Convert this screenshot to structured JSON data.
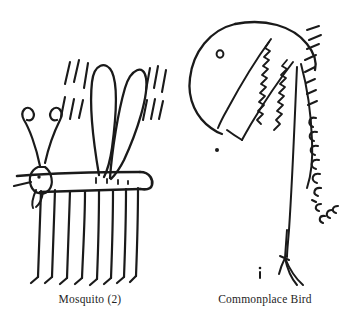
{
  "plate": {
    "background_color": "#ffffff",
    "ink_color": "#1a1a1a",
    "caption_color": "#242424",
    "width": 355,
    "height": 326
  },
  "figures": [
    {
      "id": "mosquito",
      "caption": "Mosquito (2)",
      "subject": "mosquito",
      "drawing": {
        "style": "pen-and-ink line drawing",
        "parts": [
          "two curled antennae",
          "small head with eye dot",
          "proboscis",
          "horizontal tubular body with rounded cap",
          "two upright teardrop wings",
          "motion lines left of wings",
          "motion lines right of wings",
          "eight long hanging legs with feet"
        ],
        "leg_count": 8,
        "wing_count": 2,
        "motion_line_groups": 2
      }
    },
    {
      "id": "commonplace-bird",
      "caption": "Commonplace Bird",
      "subject": "bird",
      "drawing": {
        "style": "pen-and-ink line drawing",
        "parts": [
          "rounded head dome",
          "eye dot",
          "open beak with two zigzag tooth rows",
          "long curved neck",
          "feather tick marks along back of neck",
          "curved c-shaped feather marks on lower neck",
          "single thin leg with splayed toes"
        ],
        "tooth_rows": 2,
        "leg_count": 1
      }
    }
  ]
}
